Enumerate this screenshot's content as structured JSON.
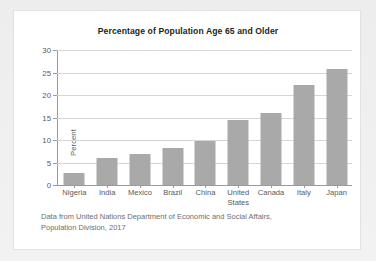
{
  "figure": {
    "title": "Percentage of Population Age 65 and Older",
    "caption_line1": "Data from United Nations Department of Economic and Social Affairs,",
    "caption_line2": "Population Division, 2017"
  },
  "chart_data": {
    "type": "bar",
    "title": "Percentage of Population Age 65 and Older",
    "xlabel": "",
    "ylabel": "Percent",
    "ylim": [
      0,
      30
    ],
    "yticks": [
      0,
      5,
      10,
      15,
      20,
      25,
      30
    ],
    "ytick_labels": [
      "0",
      "5",
      "10",
      "15",
      "20",
      "25",
      "30"
    ],
    "grid": true,
    "legend": false,
    "bar_color": "#a9a9a9",
    "categories": [
      "Nigeria",
      "India",
      "Mexico",
      "Brazil",
      "China",
      "United\nStates",
      "Canada",
      "Italy",
      "Japan"
    ],
    "values": [
      2.7,
      6.0,
      7.0,
      8.3,
      9.8,
      14.5,
      16.0,
      22.3,
      25.8
    ],
    "annotation": "Data from United Nations Department of Economic and Social Affairs, Population Division, 2017"
  }
}
